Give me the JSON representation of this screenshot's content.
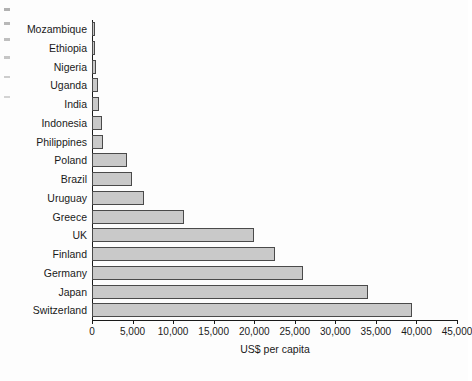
{
  "chart_data": {
    "type": "bar",
    "orientation": "horizontal",
    "title": "",
    "xlabel": "US$ per capita",
    "ylabel": "",
    "xlim": [
      0,
      45000
    ],
    "xticks": [
      0,
      5000,
      10000,
      15000,
      20000,
      25000,
      30000,
      35000,
      40000,
      45000
    ],
    "xtick_labels": [
      "0",
      "5,000",
      "10,000",
      "15,000",
      "20,000",
      "25,000",
      "30,000",
      "35,000",
      "40,000",
      "45,000"
    ],
    "grid": false,
    "legend": null,
    "bar_fill_color": "#c9c9c9",
    "bar_edge_color": "#4a4a4a",
    "categories": [
      "Mozambique",
      "Ethiopia",
      "Nigeria",
      "Uganda",
      "India",
      "Indonesia",
      "Philippines",
      "Poland",
      "Brazil",
      "Uruguay",
      "Greece",
      "UK",
      "Finland",
      "Germany",
      "Japan",
      "Switzerland"
    ],
    "values": [
      210,
      350,
      450,
      750,
      900,
      1200,
      1400,
      4300,
      4900,
      6400,
      11400,
      20000,
      22600,
      26000,
      34000,
      39500
    ]
  }
}
